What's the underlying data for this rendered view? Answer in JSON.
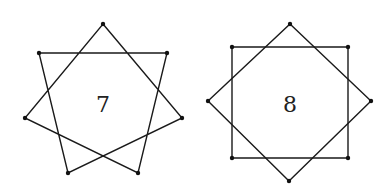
{
  "figures": [
    {
      "id": "heptagram",
      "label": "7",
      "type": "star polygon {7/2}",
      "vertices": [
        [
          103,
          24
        ],
        [
          167,
          53
        ],
        [
          182,
          118
        ],
        [
          138,
          173
        ],
        [
          68,
          173
        ],
        [
          25,
          118
        ],
        [
          39,
          53
        ]
      ],
      "step": 2,
      "label_pos": [
        103,
        112
      ]
    },
    {
      "id": "octagram",
      "label": "8",
      "type": "two overlapping squares {8/2}",
      "square_diamond": [
        [
          290,
          24
        ],
        [
          371,
          101
        ],
        [
          289,
          181
        ],
        [
          208,
          101
        ]
      ],
      "square_axis": [
        [
          232,
          47
        ],
        [
          348,
          47
        ],
        [
          348,
          158
        ],
        [
          232,
          158
        ]
      ],
      "label_pos": [
        290,
        112
      ]
    }
  ],
  "colors": {
    "stroke": "#1a1a1a",
    "vertex": "#111111",
    "background": "#ffffff"
  }
}
